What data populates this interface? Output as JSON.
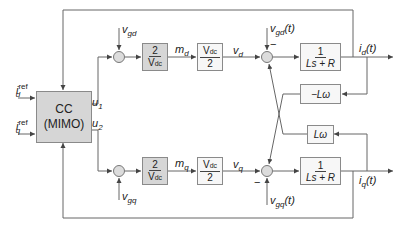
{
  "diagram": {
    "type": "block-diagram",
    "controller": {
      "line1": "CC",
      "line2": "(MIMO)"
    },
    "inputs": {
      "id_ref": {
        "base": "i",
        "sub": "d",
        "sup": "ref"
      },
      "iq_ref": {
        "base": "i",
        "sub": "q",
        "sup": "ref"
      }
    },
    "controller_outputs": {
      "u1": {
        "base": "u",
        "sub": "1"
      },
      "u2": {
        "base": "u",
        "sub": "2"
      }
    },
    "d_axis": {
      "grid_voltage_in": {
        "base": "v",
        "sub": "gd"
      },
      "modulation_gain": {
        "num": "2",
        "den": "V",
        "den_sub": "dc"
      },
      "modulation_signal": {
        "base": "m",
        "sub": "d"
      },
      "converter_gain": {
        "num": "V",
        "num_sub": "dc",
        "den": "2"
      },
      "converter_voltage": {
        "base": "v",
        "sub": "d"
      },
      "grid_disturbance": {
        "base": "v",
        "sub": "gd",
        "suffix": "(t)"
      },
      "disturbance_sign": "−",
      "plant": {
        "num": "1",
        "den": "Ls + R"
      },
      "output": {
        "base": "i",
        "sub": "d",
        "suffix": "(t)"
      },
      "coupling_gain": "−Lω"
    },
    "q_axis": {
      "grid_voltage_in": {
        "base": "v",
        "sub": "gq"
      },
      "modulation_gain": {
        "num": "2",
        "den": "V",
        "den_sub": "dc"
      },
      "modulation_signal": {
        "base": "m",
        "sub": "q"
      },
      "converter_gain": {
        "num": "V",
        "num_sub": "dc",
        "den": "2"
      },
      "converter_voltage": {
        "base": "v",
        "sub": "q"
      },
      "grid_disturbance": {
        "base": "v",
        "sub": "gq",
        "suffix": "(t)"
      },
      "disturbance_sign": "−",
      "plant": {
        "num": "1",
        "den": "Ls + R"
      },
      "output": {
        "base": "i",
        "sub": "q",
        "suffix": "(t)"
      },
      "coupling_gain": "Lω"
    },
    "colors": {
      "block_fill_gray": "#d6d6d6",
      "block_fill_white": "#f7f7f7",
      "line": "#555555"
    }
  }
}
